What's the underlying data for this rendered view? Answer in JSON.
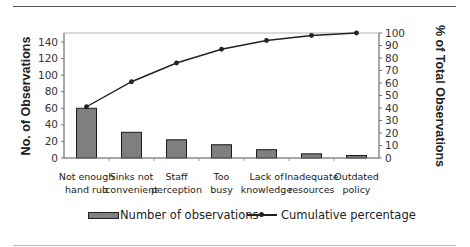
{
  "chart_data": {
    "type": "bar+line",
    "title": "",
    "categories": [
      "Not enough hand rub",
      "Sinks not convenient",
      "Staff perception",
      "Too busy",
      "Lack of knowledge",
      "Inadequate resources",
      "Outdated policy"
    ],
    "category_label_lines": [
      [
        "Not enough",
        "hand rub"
      ],
      [
        "Sinks not",
        "convenient"
      ],
      [
        "Staff",
        "perception"
      ],
      [
        "Too",
        "busy"
      ],
      [
        "Lack of",
        "knowledge"
      ],
      [
        "Inadequate",
        "resources"
      ],
      [
        "Outdated",
        "policy"
      ]
    ],
    "series": [
      {
        "name": "Number of observations",
        "type": "bar",
        "axis": "left",
        "color": "#7f7f7f",
        "values": [
          60,
          31,
          22,
          16,
          10,
          5,
          3
        ]
      },
      {
        "name": "Cumulative percentage",
        "type": "line",
        "axis": "right",
        "color": "#222222",
        "values": [
          41,
          61,
          76,
          87,
          94,
          98,
          100
        ]
      }
    ],
    "xlabel": "",
    "ylabel": "No. of Observations",
    "ylabel_right": "% of Total Observations",
    "ylim": [
      0,
      150
    ],
    "ylim_right": [
      0,
      100
    ],
    "yticks": [
      0,
      20,
      40,
      60,
      80,
      100,
      120,
      140
    ],
    "yticks_right": [
      0,
      10,
      20,
      30,
      40,
      50,
      60,
      70,
      80,
      90,
      100
    ],
    "grid": false,
    "legend_position": "bottom"
  },
  "legend": {
    "bar_label": "Number of observations",
    "line_label": "Cumulative percentage"
  }
}
